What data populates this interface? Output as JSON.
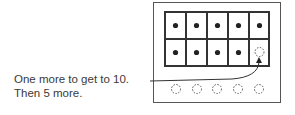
{
  "caption": {
    "line1": "One more to get to 10.",
    "line2": "Then 5 more."
  },
  "ten_frame": {
    "rows": 2,
    "cols": 5,
    "cells": [
      [
        "filled",
        "filled",
        "filled",
        "filled",
        "filled"
      ],
      [
        "filled",
        "filled",
        "filled",
        "filled",
        "empty-dashed"
      ]
    ]
  },
  "extra_counters": {
    "count": 5,
    "style": "empty-dashed"
  },
  "colors": {
    "line": "#333333",
    "dot": "#222222",
    "dashed": "#555555"
  }
}
